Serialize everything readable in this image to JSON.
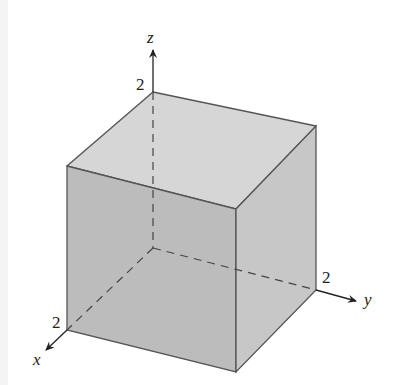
{
  "diagram": {
    "type": "3d-cube-axes",
    "axes": {
      "x": {
        "label": "x",
        "tick_label": "2"
      },
      "y": {
        "label": "y",
        "tick_label": "2"
      },
      "z": {
        "label": "z",
        "tick_label": "2"
      }
    },
    "colors": {
      "top_face": "#d4d4d4",
      "front_face": "#bdbdbd",
      "right_face": "#c6c6c6",
      "edge": "#555555",
      "axis": "#222222"
    }
  }
}
